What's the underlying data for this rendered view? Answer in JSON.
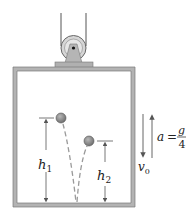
{
  "figure": {
    "colors": {
      "wall": "#a9a9a9",
      "wall_edge": "#7a7a7a",
      "ball": "#8c8c8c",
      "ball_edge": "#555555",
      "line": "#555555",
      "text": "#222222",
      "path_dash": "#9a9a9a"
    },
    "labels": {
      "h1_main": "h",
      "h1_sub": "1",
      "h2_main": "h",
      "h2_sub": "2",
      "v0_main": "v",
      "v0_sub": "0",
      "a_lhs": "a",
      "a_eq": "=",
      "a_num": "g",
      "a_den": "4"
    }
  }
}
